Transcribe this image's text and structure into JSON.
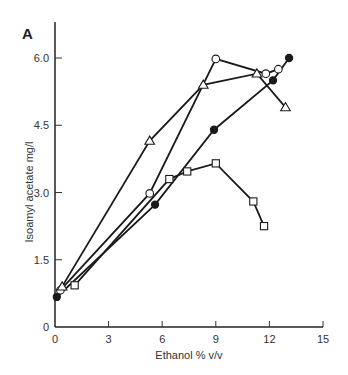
{
  "panel_label": "A",
  "chart_data": {
    "type": "line",
    "title": "",
    "xlabel": "Ethanol % v/v",
    "ylabel": "Isoamyl acetate mg/l",
    "xlim": [
      0,
      15
    ],
    "ylim": [
      0,
      6.6
    ],
    "xticks": [
      0,
      3,
      6,
      9,
      12,
      15
    ],
    "yticks": [
      0,
      1.5,
      3.0,
      4.5,
      6.0
    ],
    "ytick_labels": [
      "0",
      "1.5",
      "3.0",
      "4.5",
      "6.0"
    ],
    "grid": false,
    "legend": null,
    "series": [
      {
        "name": "filled-circle",
        "marker": "filled-circle",
        "x": [
          0.1,
          5.6,
          8.9,
          12.2,
          13.1
        ],
        "y": [
          0.67,
          2.73,
          4.4,
          5.5,
          6.0
        ]
      },
      {
        "name": "open-circle",
        "marker": "open-circle",
        "x": [
          0.3,
          5.3,
          9.0,
          11.8,
          12.5
        ],
        "y": [
          0.82,
          2.98,
          5.98,
          5.65,
          5.75
        ]
      },
      {
        "name": "open-triangle",
        "marker": "open-triangle",
        "x": [
          0.4,
          5.3,
          8.3,
          11.3,
          12.9
        ],
        "y": [
          0.9,
          4.15,
          5.4,
          5.65,
          4.9
        ]
      },
      {
        "name": "open-square",
        "marker": "open-square",
        "x": [
          1.1,
          6.4,
          7.4,
          9.0,
          11.1,
          11.7
        ],
        "y": [
          0.93,
          3.3,
          3.47,
          3.65,
          2.8,
          2.25
        ]
      }
    ]
  }
}
